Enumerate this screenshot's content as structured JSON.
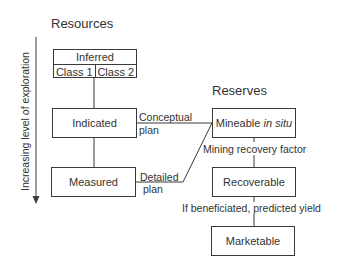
{
  "diagram": {
    "headings": {
      "resources": "Resources",
      "reserves": "Reserves"
    },
    "axis": {
      "label": "Increasing level of exploration",
      "direction": "down"
    },
    "resources": {
      "inferred": {
        "label": "Inferred",
        "classes": [
          "Class 1",
          "Class 2"
        ]
      },
      "indicated": "Indicated",
      "measured": "Measured"
    },
    "reserves": {
      "mineable": {
        "label": "Mineable",
        "italic": "in situ"
      },
      "recoverable": "Recoverable",
      "marketable": "Marketable"
    },
    "connectors": {
      "conceptual_plan": [
        "Conceptual",
        "plan"
      ],
      "detailed_plan": [
        "Detailed",
        "plan"
      ],
      "mining_recovery": "Mining recovery factor",
      "beneficiation": "If beneficiated, predicted yield"
    },
    "colors": {
      "line": "#3a3a3a",
      "text": "#333333",
      "background": "#ffffff"
    }
  }
}
